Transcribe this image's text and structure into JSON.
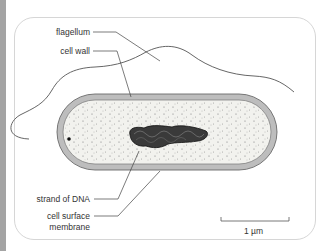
{
  "diagram": {
    "labels": {
      "flagellum": "flagellum",
      "cell_wall": "cell wall",
      "dna": "strand of DNA",
      "membrane_line1": "cell surface",
      "membrane_line2": "membrane"
    },
    "scale_bar": "1 µm",
    "colors": {
      "cell_wall": "#b9b9b9",
      "cytoplasm": "#f1f1ec",
      "dna": "#2a2a2a",
      "strip": "#a4a4a4",
      "frame": "#d6d6d6"
    }
  }
}
